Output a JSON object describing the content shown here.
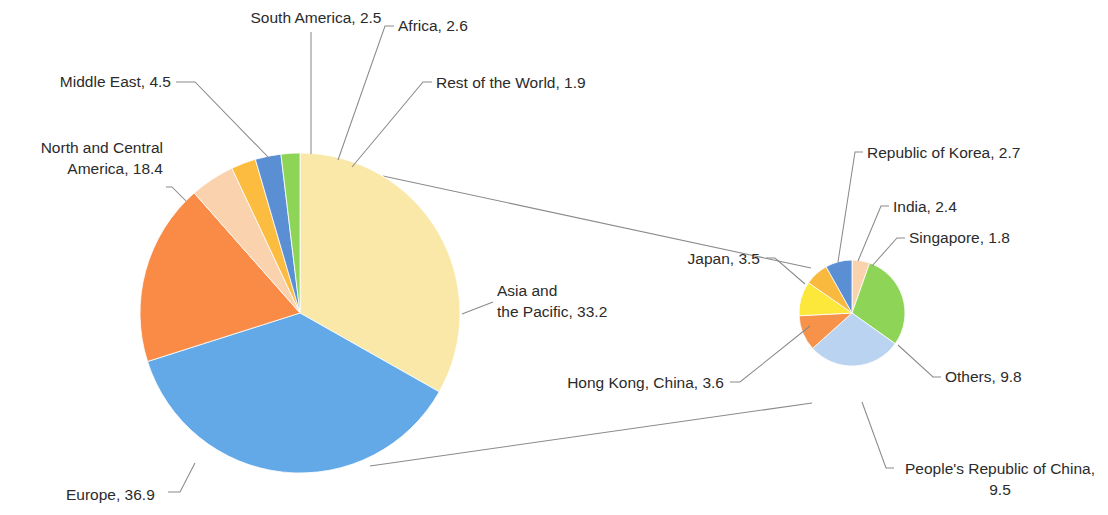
{
  "chart_data": {
    "type": "pie",
    "title": "",
    "subtitle": "",
    "variant": "pie-of-pie",
    "units": "percent",
    "legend": "none",
    "labels_format": "{name}, {value}",
    "main_pie": {
      "name": "main-pie",
      "center": [
        300,
        313
      ],
      "radius": 160,
      "start_angle_deg": 0,
      "direction": "clockwise",
      "categories": [
        "Asia and the Pacific",
        "Europe",
        "North and Central America",
        "Middle East",
        "South America",
        "Africa",
        "Rest of the World"
      ],
      "values": [
        33.2,
        36.9,
        18.4,
        4.5,
        2.5,
        2.6,
        1.9
      ],
      "colors": [
        "#FAE8A8",
        "#63A9E8",
        "#F98B46",
        "#FAD3AE",
        "#FBBC3F",
        "#5B8FD4",
        "#8ED557"
      ],
      "labels": [
        {
          "name": "Asia and the Pacific",
          "value": 33.2,
          "lines": [
            "Asia and",
            "the Pacific, 33.2"
          ],
          "x": 497,
          "y": 296,
          "anchor": "start",
          "lead": [
            [
              462,
              314
            ],
            [
              493,
              302
            ]
          ]
        },
        {
          "name": "Europe",
          "value": 36.9,
          "lines": [
            "Europe, 36.9"
          ],
          "x": 66,
          "y": 500,
          "anchor": "start",
          "lead": [
            [
              195,
              463
            ],
            [
              180,
              492
            ],
            [
              168,
              492
            ]
          ]
        },
        {
          "name": "North and Central America",
          "value": 18.4,
          "lines": [
            "North and Central",
            "America, 18.4"
          ],
          "x": 163,
          "y": 153,
          "anchor": "end",
          "lead": [
            [
              186,
              201
            ],
            [
              172,
              187
            ],
            [
              166,
              187
            ]
          ]
        },
        {
          "name": "Middle East",
          "value": 4.5,
          "lines": [
            "Middle East, 4.5"
          ],
          "x": 171,
          "y": 87,
          "anchor": "end",
          "lead": [
            [
              269,
              158
            ],
            [
              195,
              82
            ],
            [
              176,
              82
            ]
          ]
        },
        {
          "name": "South America",
          "value": 2.5,
          "lines": [
            "South America, 2.5"
          ],
          "x": 316,
          "y": 23,
          "anchor": "middle",
          "lead": [
            [
              311,
              154
            ],
            [
              311,
              32
            ]
          ]
        },
        {
          "name": "Africa",
          "value": 2.6,
          "lines": [
            "Africa, 2.6"
          ],
          "x": 398,
          "y": 31,
          "anchor": "start",
          "lead": [
            [
              338,
              160
            ],
            [
              385,
              26
            ],
            [
              394,
              26
            ]
          ]
        },
        {
          "name": "Rest of the World",
          "value": 1.9,
          "lines": [
            "Rest of the World, 1.9"
          ],
          "x": 436,
          "y": 88,
          "anchor": "start",
          "lead": [
            [
              352,
              167
            ],
            [
              423,
              82
            ],
            [
              432,
              82
            ]
          ]
        }
      ]
    },
    "secondary_pie": {
      "name": "secondary-pie",
      "expanded_from": "Asia and the Pacific",
      "center": [
        852,
        313
      ],
      "radius": 53,
      "start_angle_deg": 0,
      "direction": "clockwise",
      "categories": [
        "Singapore",
        "Others",
        "People's Republic of China",
        "Hong Kong, China",
        "Japan",
        "India",
        "Republic of Korea"
      ],
      "values": [
        1.8,
        9.8,
        9.5,
        3.6,
        3.5,
        2.4,
        2.7
      ],
      "colors": [
        "#FAD3AE",
        "#8ED557",
        "#B9D3F0",
        "#F6924A",
        "#FCE73B",
        "#F9B93F",
        "#5B8FD4"
      ],
      "labels": [
        {
          "name": "Republic of Korea",
          "value": 2.7,
          "lines": [
            "Republic of Korea, 2.7"
          ],
          "x": 867,
          "y": 158,
          "anchor": "start",
          "lead": [
            [
              838,
              262
            ],
            [
              855,
              152
            ],
            [
              863,
              152
            ]
          ]
        },
        {
          "name": "India",
          "value": 2.4,
          "lines": [
            "India, 2.4"
          ],
          "x": 893,
          "y": 212,
          "anchor": "start",
          "lead": [
            [
              858,
              261
            ],
            [
              881,
              206
            ],
            [
              889,
              206
            ]
          ]
        },
        {
          "name": "Singapore",
          "value": 1.8,
          "lines": [
            "Singapore, 1.8"
          ],
          "x": 909,
          "y": 243,
          "anchor": "start",
          "lead": [
            [
              872,
              266
            ],
            [
              897,
              238
            ],
            [
              905,
              238
            ]
          ]
        },
        {
          "name": "Others",
          "value": 9.8,
          "lines": [
            "Others, 9.8"
          ],
          "x": 945,
          "y": 382,
          "anchor": "start",
          "lead": [
            [
              898,
              345
            ],
            [
              933,
              377
            ],
            [
              941,
              377
            ]
          ]
        },
        {
          "name": "People's Republic of China",
          "value": 9.5,
          "lines": [
            "People's Republic of China,",
            "9.5"
          ],
          "x": 1000,
          "y": 474,
          "anchor": "middle",
          "lead": [
            [
              862,
              402
            ],
            [
              886,
              468
            ],
            [
              894,
              468
            ]
          ]
        },
        {
          "name": "Hong Kong, China",
          "value": 3.6,
          "lines": [
            "Hong Kong, China, 3.6"
          ],
          "x": 724,
          "y": 388,
          "anchor": "end",
          "lead": [
            [
              810,
              326
            ],
            [
              740,
              382
            ],
            [
              730,
              382
            ]
          ]
        },
        {
          "name": "Japan",
          "value": 3.5,
          "lines": [
            "Japan, 3.5"
          ],
          "x": 760,
          "y": 264,
          "anchor": "end",
          "lead": [
            [
              805,
              284
            ],
            [
              775,
              258
            ],
            [
              766,
              258
            ]
          ]
        }
      ]
    },
    "connectors": [
      {
        "name": "top-connector",
        "points": [
          [
            383,
            176
          ],
          [
            811,
            268
          ]
        ]
      },
      {
        "name": "bottom-connector",
        "points": [
          [
            370,
            466
          ],
          [
            812,
            403
          ]
        ]
      }
    ]
  }
}
